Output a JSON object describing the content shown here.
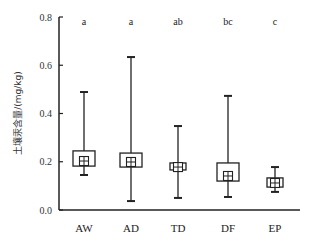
{
  "chart_data": {
    "type": "box",
    "title": "",
    "xlabel": "",
    "ylabel": "土壤汞含量/(mg/kg)",
    "ylim": [
      0,
      0.8
    ],
    "yticks": [
      "0.0",
      "0.2",
      "0.4",
      "0.6",
      "0.8"
    ],
    "ytick_values": [
      0,
      0.2,
      0.4,
      0.6,
      0.8
    ],
    "grid": false,
    "categories": [
      "AW",
      "AD",
      "TD",
      "DF",
      "EP"
    ],
    "significance": [
      "a",
      "a",
      "ab",
      "bc",
      "c"
    ],
    "boxes": [
      {
        "name": "AW",
        "whisker_low": 0.145,
        "q1": 0.182,
        "median": 0.203,
        "q3": 0.245,
        "whisker_high": 0.489
      },
      {
        "name": "AD",
        "whisker_low": 0.037,
        "q1": 0.178,
        "median": 0.199,
        "q3": 0.236,
        "whisker_high": 0.634
      },
      {
        "name": "TD",
        "whisker_low": 0.05,
        "q1": 0.166,
        "median": 0.178,
        "q3": 0.195,
        "whisker_high": 0.348
      },
      {
        "name": "DF",
        "whisker_low": 0.054,
        "q1": 0.12,
        "median": 0.141,
        "q3": 0.195,
        "whisker_high": 0.473
      },
      {
        "name": "EP",
        "whisker_low": 0.075,
        "q1": 0.095,
        "median": 0.112,
        "q3": 0.133,
        "whisker_high": 0.178
      }
    ]
  }
}
